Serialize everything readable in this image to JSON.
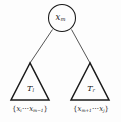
{
  "figure": {
    "type": "binary-search-tree-diagram",
    "colors": {
      "background": "#fdfdfd",
      "stroke": "#1a1a1a",
      "edge_stroke": "#2a2a2a",
      "text": "#1a1a1a"
    },
    "root_node": {
      "shape": "circle",
      "center_x": 62,
      "center_y": 18,
      "radius": 14,
      "key_base": "x",
      "key_subscript": "m",
      "key_text": "x_m"
    },
    "edges": [
      {
        "name": "edge-to-left-subtree",
        "from": "root_node",
        "to": "left_subtree"
      },
      {
        "name": "edge-to-right-subtree",
        "from": "root_node",
        "to": "right_subtree"
      }
    ],
    "left_subtree": {
      "shape": "triangle",
      "label_base": "T",
      "label_subscript": "l",
      "label_text": "T_l",
      "apex_x": 30,
      "apex_y": 63,
      "base_y": 100,
      "base_left_x": 11,
      "base_right_x": 49,
      "set_label": {
        "open_brace": "{",
        "first_base": "x",
        "first_subscript": "i",
        "dots": "⋯",
        "last_base": "x",
        "last_subscript": "m−1",
        "close_brace": "}",
        "text": "{x_i ⋯ x_{m−1}}"
      }
    },
    "right_subtree": {
      "shape": "triangle",
      "label_base": "T",
      "label_subscript": "r",
      "label_text": "T_r",
      "apex_x": 90,
      "apex_y": 63,
      "base_y": 100,
      "base_left_x": 71,
      "base_right_x": 109,
      "set_label": {
        "open_brace": "{",
        "first_base": "x",
        "first_subscript": "m+1",
        "dots": "⋯",
        "last_base": "x",
        "last_subscript": "j",
        "close_brace": "}",
        "text": "{x_{m+1} ⋯ x_j}"
      }
    }
  }
}
